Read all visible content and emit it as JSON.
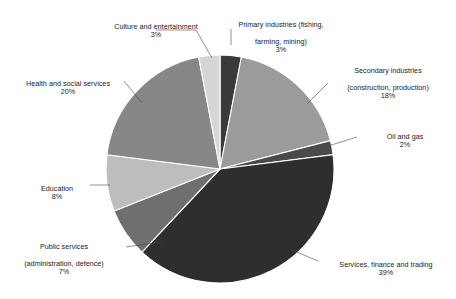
{
  "chart_data": {
    "type": "pie",
    "title": "",
    "subtitle": "",
    "xlabel": "",
    "ylabel": "",
    "legend_position": "none",
    "grid": false,
    "labels_show_percent": true,
    "start_angle_deg": 0,
    "direction": "clockwise",
    "categories": [
      "Primary industries (fishing, farming, mining)",
      "Secondary industries (construction, production)",
      "Oil and gas",
      "Services, finance and trading",
      "Public services (administration, defence)",
      "Education",
      "Health and social services",
      "Culture and entertainment"
    ],
    "values": [
      3,
      18,
      2,
      39,
      7,
      8,
      20,
      3
    ],
    "value_labels": [
      "3%",
      "18%",
      "2%",
      "39%",
      "7%",
      "8%",
      "20%",
      "3%"
    ],
    "colors": [
      "#3a3a3a",
      "#9b9b9b",
      "#4a4a4a",
      "#2e2e2e",
      "#6f6f6f",
      "#bdbdbd",
      "#878787",
      "#d6d6d6"
    ],
    "slice_border_color": "#ffffff",
    "total": 100
  },
  "slices": [
    {
      "name": "primary-industries",
      "line1": "Primary industries (fishing,",
      "line2": "farming, mining)",
      "percent": "3%",
      "color": "#3a3a3a"
    },
    {
      "name": "secondary-industries",
      "line1": "Secondary industries",
      "line2": "(construction, production)",
      "percent": "18%",
      "color": "#9b9b9b"
    },
    {
      "name": "oil-and-gas",
      "line1": "Oil and gas",
      "line2": "",
      "percent": "2%",
      "color": "#4a4a4a"
    },
    {
      "name": "services-finance-trading",
      "line1": "Services, finance and trading",
      "line2": "",
      "percent": "39%",
      "color": "#2e2e2e"
    },
    {
      "name": "public-services",
      "line1": "Public services",
      "line2": "(administration, defence)",
      "percent": "7%",
      "color": "#6f6f6f"
    },
    {
      "name": "education",
      "line1": "Education",
      "line2": "",
      "percent": "8%",
      "color": "#bdbdbd"
    },
    {
      "name": "health-and-social-services",
      "line1": "Health and social services",
      "line2": "",
      "percent": "20%",
      "color": "#878787"
    },
    {
      "name": "culture-and-entertainment",
      "line1": "Culture and entertainment",
      "line2": "",
      "percent": "3%",
      "color": "#d6d6d6"
    }
  ],
  "labels": {
    "culture": {
      "line1": "Culture and entertainment",
      "percent": "3%"
    },
    "primary": {
      "line1": "Primary industries (fishing,",
      "line2": "farming, mining)",
      "percent": "3%"
    },
    "secondary": {
      "line1": "Secondary industries",
      "line2": "(construction, production)",
      "percent": "18%"
    },
    "oil": {
      "line1": "Oil and gas",
      "percent": "2%"
    },
    "services": {
      "line1": "Services, finance and trading",
      "percent": "39%"
    },
    "public": {
      "line1": "Public services",
      "line2": "(administration, defence)",
      "percent": "7%"
    },
    "education": {
      "line1": "Education",
      "percent": "8%"
    },
    "health": {
      "line1": "Health and social services",
      "percent": "20%"
    }
  },
  "geometry": {
    "center_x": 220,
    "center_y": 169,
    "radius": 114
  }
}
